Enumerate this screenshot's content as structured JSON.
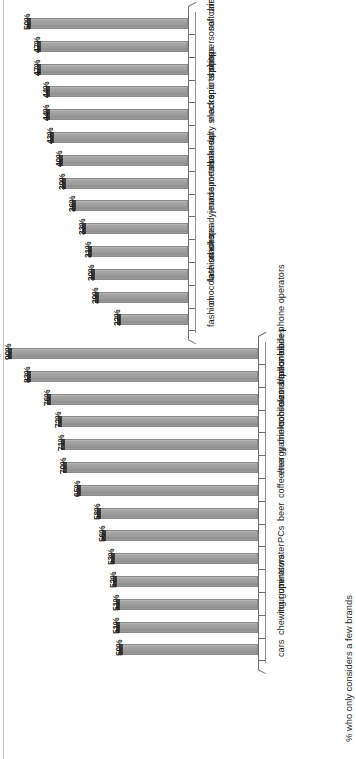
{
  "figure": {
    "axis_title": "% who only considers a few brands",
    "orientation": "rotated-90"
  },
  "chart_data": [
    {
      "id": "chart-bottom",
      "type": "bar",
      "title": "",
      "xlabel": "",
      "ylabel": "% who only considers a few brands",
      "ylim": [
        0,
        100
      ],
      "grid": false,
      "legend": "none",
      "categories": [
        "mobile phone operators",
        "banks",
        "razors/razor blades",
        "mobile/smartphones",
        "game consoles",
        "energy drinks",
        "coffee/tea",
        "beer",
        "PCs",
        "water",
        "mints",
        "tour operators",
        "chewing gum",
        "cars"
      ],
      "values": [
        90,
        83,
        76,
        72,
        71,
        70,
        65,
        58,
        56,
        53,
        52,
        51,
        51,
        50
      ],
      "labels": [
        "90%",
        "83%",
        "76%",
        "72%",
        "71%",
        "70%",
        "65%",
        "58%",
        "56%",
        "53%",
        "52%",
        "51%",
        "51%",
        "50%"
      ]
    },
    {
      "id": "chart-top",
      "type": "bar",
      "title": "",
      "xlabel": "",
      "ylabel": "",
      "ylim": [
        0,
        100
      ],
      "grid": false,
      "legend": "none",
      "categories": [
        "soft drinks",
        "personal care",
        "spirits",
        "sports shops",
        "electronic shops",
        "salty snacks",
        "make-up",
        "sports brands",
        "jeans",
        "ready-made meals",
        "shoes",
        "fashion shops",
        "chocolate snacks",
        "fashion"
      ],
      "values": [
        50,
        47,
        47,
        44,
        44,
        43,
        40,
        39,
        36,
        33,
        31,
        30,
        29,
        22
      ],
      "labels": [
        "50%",
        "47%",
        "47%",
        "44%",
        "44%",
        "43%",
        "40%",
        "39%",
        "36%",
        "33%",
        "31%",
        "30%",
        "29%",
        "22%"
      ]
    }
  ]
}
